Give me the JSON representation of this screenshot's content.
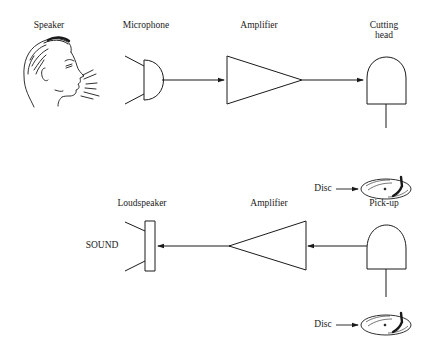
{
  "diagram": {
    "recording_chain": {
      "speaker_label": "Speaker",
      "microphone_label": "Microphone",
      "amplifier_label": "Amplifier",
      "cutting_head_label": "Cutting\nhead",
      "disc_label": "Disc"
    },
    "playback_chain": {
      "loudspeaker_label": "Loudspeaker",
      "sound_label": "SOUND",
      "amplifier_label": "Amplifier",
      "pickup_label": "Pick-up",
      "disc_label": "Disc"
    },
    "colors": {
      "line": "#1a1a1a",
      "background": "#ffffff"
    }
  }
}
